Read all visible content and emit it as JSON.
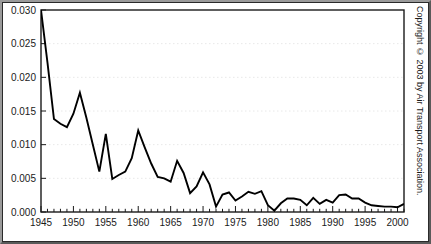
{
  "figure": {
    "copyright": "Copyright © 2003 by Air Transport Association.",
    "background_color": "#ffffff",
    "line_color": "#000000",
    "grid_color": "#e8e8e8",
    "axis_color": "#1a1a1a"
  },
  "chart_data": {
    "type": "line",
    "title": "",
    "subtitle": "",
    "xlabel": "",
    "ylabel": "",
    "xlim": [
      1945,
      2001
    ],
    "ylim": [
      0.0,
      0.03
    ],
    "grid": true,
    "legend": null,
    "y_ticks": [
      0.0,
      0.005,
      0.01,
      0.015,
      0.02,
      0.025,
      0.03
    ],
    "y_tick_labels": [
      "0.000",
      "0.005",
      "0.010",
      "0.015",
      "0.020",
      "0.025",
      "0.030"
    ],
    "x_ticks": [
      1945,
      1950,
      1955,
      1960,
      1965,
      1970,
      1975,
      1980,
      1985,
      1990,
      1995,
      2000
    ],
    "x_tick_labels": [
      "1945",
      "1950",
      "1955",
      "1960",
      "1965",
      "1970",
      "1975",
      "1980",
      "1985",
      "1990",
      "1995",
      "2000"
    ],
    "x_minor_tick_interval": 1,
    "note": "Series is clipped at the top of the axis at 1945; first plotted value reaches 0.030 at the axis maximum.",
    "x": [
      1945,
      1946,
      1947,
      1948,
      1949,
      1950,
      1951,
      1952,
      1953,
      1954,
      1955,
      1956,
      1957,
      1958,
      1959,
      1960,
      1961,
      1962,
      1963,
      1964,
      1965,
      1966,
      1967,
      1968,
      1969,
      1970,
      1971,
      1972,
      1973,
      1974,
      1975,
      1976,
      1977,
      1978,
      1979,
      1980,
      1981,
      1982,
      1983,
      1984,
      1985,
      1986,
      1987,
      1988,
      1989,
      1990,
      1991,
      1992,
      1993,
      1994,
      1995,
      1996,
      1997,
      1998,
      1999,
      2000,
      2001
    ],
    "y": [
      0.03,
      0.0222,
      0.0138,
      0.0131,
      0.0126,
      0.0146,
      0.0177,
      0.014,
      0.01,
      0.006,
      0.0116,
      0.0049,
      0.0055,
      0.006,
      0.008,
      0.0121,
      0.0096,
      0.0072,
      0.0052,
      0.005,
      0.0045,
      0.0076,
      0.0058,
      0.0028,
      0.0038,
      0.0059,
      0.0041,
      0.0008,
      0.0026,
      0.0029,
      0.0017,
      0.0023,
      0.003,
      0.0027,
      0.0031,
      0.001,
      0.0002,
      0.0013,
      0.002,
      0.002,
      0.0018,
      0.001,
      0.0021,
      0.0012,
      0.0018,
      0.0014,
      0.0025,
      0.0026,
      0.002,
      0.002,
      0.0014,
      0.001,
      0.0009,
      0.0008,
      0.0008,
      0.0007,
      0.0012
    ]
  }
}
